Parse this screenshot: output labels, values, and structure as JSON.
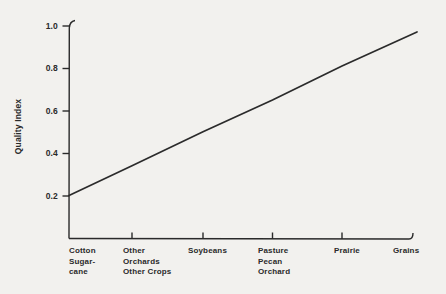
{
  "figure": {
    "ylabel": "Quality Index",
    "y_tick_labels": [
      "1.0",
      "0.8",
      "0.6",
      "0.4",
      "0.2"
    ],
    "x_labels": [
      {
        "line1": "Cotton",
        "line2": "Sugar-",
        "line3": "cane"
      },
      {
        "line1": "Other",
        "line2": "Orchards",
        "line3": "Other Crops"
      },
      {
        "line1": "Soybeans",
        "line2": "",
        "line3": ""
      },
      {
        "line1": "Pasture",
        "line2": "Pecan",
        "line3": "Orchard"
      },
      {
        "line1": "Prairie",
        "line2": "",
        "line3": ""
      },
      {
        "line1": "Grains",
        "line2": "",
        "line3": ""
      }
    ]
  },
  "chart_data": {
    "type": "line",
    "categories": [
      "Cotton Sugar-cane",
      "Other Orchards Other Crops",
      "Soybeans",
      "Pasture Pecan Orchard",
      "Prairie",
      "Grains"
    ],
    "values": [
      0.2,
      0.34,
      0.5,
      0.65,
      0.81,
      0.97
    ],
    "title": "",
    "xlabel": "",
    "ylabel": "Quality Index",
    "ylim": [
      0,
      1.0
    ],
    "y_ticks": [
      0.2,
      0.4,
      0.6,
      0.8,
      1.0
    ],
    "grid": false,
    "legend": "none",
    "line_color": "#2b2b2b"
  },
  "colors": {
    "background": "#f2f1ee",
    "axis": "#2a2a2a",
    "text": "#2a2a2a"
  }
}
